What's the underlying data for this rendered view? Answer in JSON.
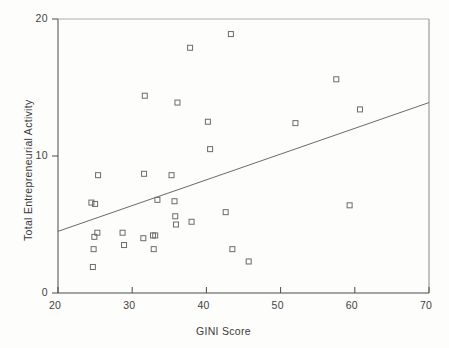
{
  "chart_data": {
    "type": "scatter",
    "title": "",
    "xlabel": "GINI Score",
    "ylabel": "Total Entrepreneurial Activity",
    "xlim": [
      20,
      70
    ],
    "ylim": [
      0,
      20
    ],
    "xticks": [
      "20",
      "30",
      "40",
      "50",
      "60",
      "70"
    ],
    "xtick_values": [
      20,
      30,
      40,
      50,
      60,
      70
    ],
    "yticks": [
      "0",
      "10",
      "20"
    ],
    "ytick_values": [
      0,
      10,
      20
    ],
    "grid": false,
    "legend": null,
    "marker": "open-square",
    "marker_color": "#6b6b6b",
    "series": [
      {
        "name": "Countries",
        "points": [
          [
            24.5,
            6.6
          ],
          [
            25.0,
            6.5
          ],
          [
            25.4,
            8.6
          ],
          [
            24.9,
            4.1
          ],
          [
            25.3,
            4.4
          ],
          [
            24.8,
            3.2
          ],
          [
            24.7,
            1.9
          ],
          [
            28.7,
            4.4
          ],
          [
            28.9,
            3.5
          ],
          [
            31.5,
            4.0
          ],
          [
            31.6,
            8.7
          ],
          [
            31.7,
            14.4
          ],
          [
            32.8,
            4.2
          ],
          [
            33.1,
            4.2
          ],
          [
            32.9,
            3.2
          ],
          [
            33.4,
            6.8
          ],
          [
            35.3,
            8.6
          ],
          [
            35.7,
            6.7
          ],
          [
            35.8,
            5.6
          ],
          [
            35.9,
            5.0
          ],
          [
            36.1,
            13.9
          ],
          [
            37.8,
            17.9
          ],
          [
            38.0,
            5.2
          ],
          [
            40.2,
            12.5
          ],
          [
            40.5,
            10.5
          ],
          [
            42.6,
            5.9
          ],
          [
            43.3,
            18.9
          ],
          [
            43.5,
            3.2
          ],
          [
            45.7,
            2.3
          ],
          [
            52.0,
            12.4
          ],
          [
            57.5,
            15.6
          ],
          [
            59.3,
            6.4
          ],
          [
            60.7,
            13.4
          ]
        ]
      }
    ],
    "trendline": {
      "name": "linear-fit",
      "x_start": 20,
      "y_start": 4.5,
      "x_end": 70,
      "y_end": 13.9,
      "color": "#6a6a6a"
    }
  },
  "axes": {
    "x_title": "GINI Score",
    "y_title": "Total Entrepreneurial Activity",
    "x_tick_labels": [
      "20",
      "30",
      "40",
      "50",
      "60",
      "70"
    ],
    "y_tick_labels": [
      "0",
      "10",
      "20"
    ]
  }
}
